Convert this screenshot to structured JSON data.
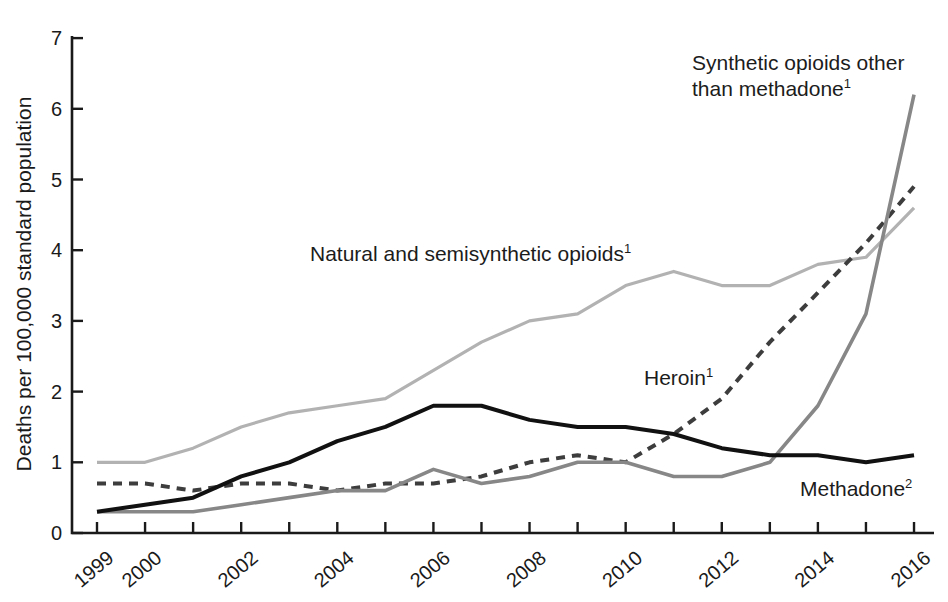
{
  "chart_data": {
    "type": "line",
    "title": "",
    "xlabel": "",
    "ylabel": "Deaths per 100,000 standard population",
    "x": [
      1999,
      2000,
      2001,
      2002,
      2003,
      2004,
      2005,
      2006,
      2007,
      2008,
      2009,
      2010,
      2011,
      2012,
      2013,
      2014,
      2015,
      2016
    ],
    "x_tick_labels": [
      "1999",
      "2000",
      "2002",
      "2004",
      "2006",
      "2008",
      "2010",
      "2012",
      "2014",
      "2016"
    ],
    "ylim": [
      0,
      7
    ],
    "y_ticks": [
      0,
      1,
      2,
      3,
      4,
      5,
      6,
      7
    ],
    "grid": false,
    "legend": "inline-annotations",
    "axis_color": "#1a1a1a",
    "series": [
      {
        "name": "Natural and semisynthetic opioids",
        "footnote": "1",
        "color": "#b2b2b2",
        "dash": null,
        "stroke_width": 3.2,
        "values": [
          1.0,
          1.0,
          1.2,
          1.5,
          1.7,
          1.8,
          1.9,
          2.3,
          2.7,
          3.0,
          3.1,
          3.5,
          3.7,
          3.5,
          3.5,
          3.8,
          3.9,
          4.6
        ]
      },
      {
        "name": "Heroin",
        "footnote": "1",
        "color": "#3d3d3d",
        "dash": "9 7",
        "stroke_width": 4,
        "values": [
          0.7,
          0.7,
          0.6,
          0.7,
          0.7,
          0.6,
          0.7,
          0.7,
          0.8,
          1.0,
          1.1,
          1.0,
          1.4,
          1.9,
          2.7,
          3.4,
          4.1,
          4.9
        ]
      },
      {
        "name": "Methadone",
        "footnote": "2",
        "color": "#111111",
        "dash": null,
        "stroke_width": 4,
        "values": [
          0.3,
          0.4,
          0.5,
          0.8,
          1.0,
          1.3,
          1.5,
          1.8,
          1.8,
          1.6,
          1.5,
          1.5,
          1.4,
          1.2,
          1.1,
          1.1,
          1.0,
          1.1
        ]
      },
      {
        "name": "Synthetic opioids other than methadone",
        "footnote": "1",
        "color": "#878787",
        "dash": null,
        "stroke_width": 3.6,
        "values": [
          0.3,
          0.3,
          0.3,
          0.4,
          0.5,
          0.6,
          0.6,
          0.9,
          0.7,
          0.8,
          1.0,
          1.0,
          0.8,
          0.8,
          1.0,
          1.8,
          3.1,
          6.2
        ]
      }
    ]
  }
}
